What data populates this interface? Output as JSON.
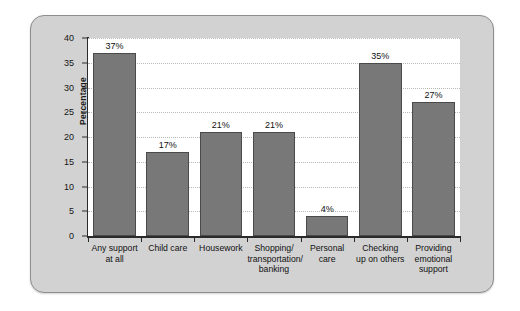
{
  "chart_data": {
    "type": "bar",
    "title": "",
    "subtitle": "",
    "xlabel": "",
    "ylabel": "Percentage",
    "ylim": [
      0,
      40
    ],
    "ytick_values": [
      0,
      5,
      10,
      15,
      20,
      25,
      30,
      35,
      40
    ],
    "ytick_labels": [
      "0",
      "5",
      "10",
      "15",
      "20",
      "25",
      "30",
      "35",
      "40"
    ],
    "grid": true,
    "grid_axis": "y",
    "legend": false,
    "legend_position": "none",
    "categories": [
      "Any support at all",
      "Child care",
      "Housework",
      "Shopping/ transportation/ banking",
      "Personal care",
      "Checking up on others",
      "Providing emotional support"
    ],
    "category_lines": [
      [
        "Any support",
        "at all"
      ],
      [
        "Child care"
      ],
      [
        "Housework"
      ],
      [
        "Shopping/",
        "transportation/",
        "banking"
      ],
      [
        "Personal",
        "care"
      ],
      [
        "Checking",
        "up on others"
      ],
      [
        "Providing",
        "emotional",
        "support"
      ]
    ],
    "values": [
      37,
      17,
      21,
      21,
      4,
      35,
      27
    ],
    "data_labels": [
      "37%",
      "17%",
      "21%",
      "21%",
      "4%",
      "35%",
      "27%"
    ],
    "bar_color": "#787878",
    "bar_edge_color": "#4a4a4a",
    "plot_background": "#ffffff",
    "panel_background": "#d2d2d2",
    "gridline_color": "#b9b9b9",
    "axis_color": "#2a2a2a",
    "text_color": "#111111"
  }
}
